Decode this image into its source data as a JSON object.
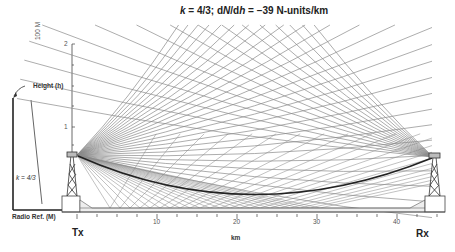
{
  "figure": {
    "title_parts": {
      "k": "k",
      "k_value": " = 4/3; d",
      "N": "N",
      "slash": "/d",
      "h": "h",
      "gradient": " = −39 N-units/km"
    },
    "y_axis": {
      "unit_label": "100 M",
      "tick_labels": [
        "2",
        "1"
      ]
    },
    "x_axis": {
      "label": "km",
      "tick_labels": [
        "10",
        "20",
        "30",
        "40"
      ],
      "range_km": [
        0,
        45
      ]
    },
    "stations": {
      "transmitter": "Tx",
      "receiver": "Rx"
    },
    "inset": {
      "height_label": "Height (h)",
      "refractivity_label": "Radio Ref. (M)",
      "k_label": "k = 4/3"
    },
    "colors": {
      "rays": "#8a8a8a",
      "main_ray": "#222222",
      "axis": "#333333"
    }
  }
}
